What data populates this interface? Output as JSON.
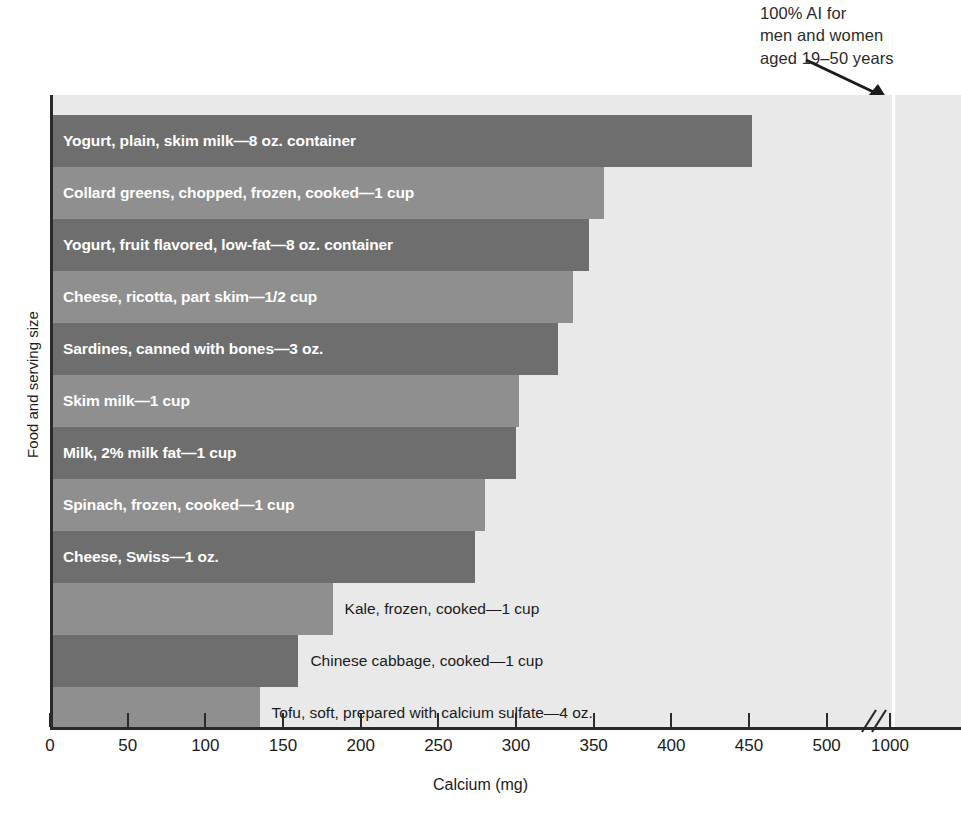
{
  "chart_data": {
    "type": "bar",
    "title": "",
    "xlabel": "Calcium (mg)",
    "ylabel": "Food and serving size",
    "orientation": "horizontal",
    "xlim": [
      0,
      1040
    ],
    "axis_break": {
      "after": 520,
      "before": 1000,
      "label": "//"
    },
    "xticks": [
      0,
      50,
      100,
      150,
      200,
      250,
      300,
      350,
      400,
      450,
      500,
      1000
    ],
    "xticklabels": [
      "0",
      "50",
      "100",
      "150",
      "200",
      "250",
      "300",
      "350",
      "400",
      "450",
      "500",
      "1000"
    ],
    "grid": false,
    "legend": null,
    "reference_line": {
      "value": 1000,
      "color": "#ffffff",
      "annotation": [
        "100% AI for",
        "men and women",
        "aged 19–50 years"
      ]
    },
    "colors": {
      "bar_dark": "#6e6e6e",
      "bar_light": "#8f8f8f",
      "plot_background": "#e9e9e9",
      "axis": "#2a2a2a",
      "inside_label": "#ffffff",
      "outside_label": "#1b1b1b"
    },
    "categories": [
      "Yogurt, plain, skim milk—8 oz. container",
      "Collard greens, chopped, frozen, cooked—1 cup",
      "Yogurt, fruit flavored, low-fat—8 oz. container",
      "Cheese, ricotta, part skim—1/2 cup",
      "Sardines, canned with bones—3 oz.",
      "Skim milk—1 cup",
      "Milk, 2% milk fat—1 cup",
      "Spinach, frozen, cooked—1 cup",
      "Cheese, Swiss—1 oz.",
      "Kale, frozen, cooked—1 cup",
      "Chinese cabbage, cooked—1 cup",
      "Tofu, soft, prepared with calcium sulfate—4 oz."
    ],
    "values": [
      450,
      355,
      345,
      335,
      325,
      300,
      298,
      278,
      272,
      180,
      158,
      133
    ],
    "bars": [
      {
        "label": "Yogurt, plain, skim milk—8 oz. container",
        "value": 450,
        "shade": "dark",
        "label_position": "inside"
      },
      {
        "label": "Collard greens, chopped, frozen, cooked—1 cup",
        "value": 355,
        "shade": "light",
        "label_position": "inside"
      },
      {
        "label": "Yogurt, fruit flavored, low-fat—8 oz. container",
        "value": 345,
        "shade": "dark",
        "label_position": "inside"
      },
      {
        "label": "Cheese, ricotta, part skim—1/2 cup",
        "value": 335,
        "shade": "light",
        "label_position": "inside"
      },
      {
        "label": "Sardines, canned with bones—3 oz.",
        "value": 325,
        "shade": "dark",
        "label_position": "inside"
      },
      {
        "label": "Skim milk—1 cup",
        "value": 300,
        "shade": "light",
        "label_position": "inside"
      },
      {
        "label": "Milk, 2% milk fat—1 cup",
        "value": 298,
        "shade": "dark",
        "label_position": "inside"
      },
      {
        "label": "Spinach, frozen, cooked—1 cup",
        "value": 278,
        "shade": "light",
        "label_position": "inside"
      },
      {
        "label": "Cheese, Swiss—1 oz.",
        "value": 272,
        "shade": "dark",
        "label_position": "inside"
      },
      {
        "label": "Kale, frozen, cooked—1 cup",
        "value": 180,
        "shade": "light",
        "label_position": "outside"
      },
      {
        "label": "Chinese cabbage, cooked—1 cup",
        "value": 158,
        "shade": "dark",
        "label_position": "outside"
      },
      {
        "label": "Tofu, soft, prepared with calcium sulfate—4 oz.",
        "value": 133,
        "shade": "light",
        "label_position": "outside"
      }
    ]
  }
}
